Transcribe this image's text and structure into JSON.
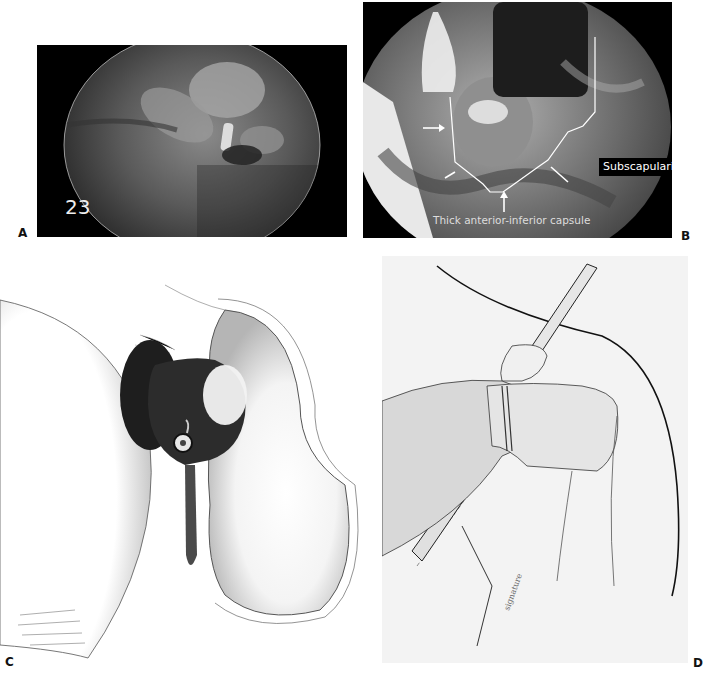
{
  "figure": {
    "panels": [
      {
        "id": "A",
        "label": "A",
        "type": "arthroscopic-photo",
        "overlay_number": "23"
      },
      {
        "id": "B",
        "label": "B",
        "type": "arthroscopic-photo",
        "annotations": [
          "Subscapularis",
          "Thick anterior-inferior capsule"
        ]
      },
      {
        "id": "C",
        "label": "C",
        "type": "illustration"
      },
      {
        "id": "D",
        "label": "D",
        "type": "illustration"
      }
    ]
  }
}
